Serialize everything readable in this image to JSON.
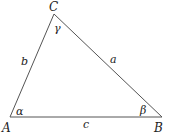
{
  "diagram": {
    "vertices": {
      "A": {
        "label": "A",
        "x": 10,
        "y": 117
      },
      "B": {
        "label": "B",
        "x": 162,
        "y": 117
      },
      "C": {
        "label": "C",
        "x": 54,
        "y": 14
      }
    },
    "sides": {
      "a": {
        "label": "a",
        "between": [
          "B",
          "C"
        ]
      },
      "b": {
        "label": "b",
        "between": [
          "A",
          "C"
        ]
      },
      "c": {
        "label": "c",
        "between": [
          "A",
          "B"
        ]
      }
    },
    "angles": {
      "alpha": {
        "label": "α",
        "at": "A"
      },
      "beta": {
        "label": "β",
        "at": "B"
      },
      "gamma": {
        "label": "γ",
        "at": "C"
      }
    },
    "line_color": "#555555"
  }
}
